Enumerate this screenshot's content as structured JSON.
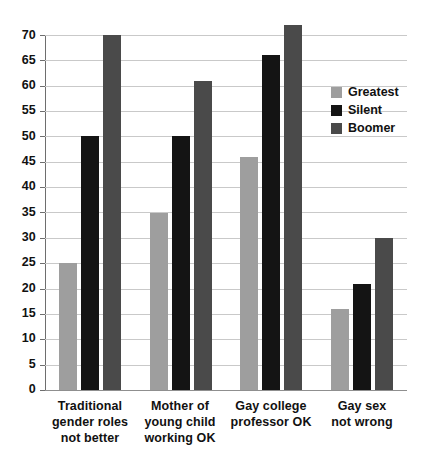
{
  "chart_data": {
    "type": "bar",
    "title": "",
    "subtitle": "",
    "xlabel": "",
    "ylabel": "",
    "ylim": [
      0,
      70
    ],
    "ytick_step": 5,
    "yticks": [
      0,
      5,
      10,
      15,
      20,
      25,
      30,
      35,
      40,
      45,
      50,
      55,
      60,
      65,
      70
    ],
    "grid": true,
    "grid_axis": "y",
    "legend_position": "upper right (inside plot)",
    "categories": [
      "Traditional\ngender roles\nnot better",
      "Mother of\nyoung child\nworking OK",
      "Gay college\nprofessor OK",
      "Gay sex\nnot wrong"
    ],
    "series": [
      {
        "name": "Greatest",
        "color": "#9e9e9e",
        "values": [
          25,
          35,
          46,
          16
        ]
      },
      {
        "name": "Silent",
        "color": "#141414",
        "values": [
          50,
          50,
          66,
          21
        ]
      },
      {
        "name": "Boomer",
        "color": "#4a4a4a",
        "values": [
          70,
          61,
          72,
          30
        ]
      }
    ]
  },
  "axis": {
    "y_tick_labels": [
      "70",
      "65",
      "60",
      "55",
      "50",
      "45",
      "40",
      "35",
      "30",
      "25",
      "20",
      "15",
      "10",
      "5",
      "0"
    ]
  },
  "categories_display": [
    {
      "line1": "Traditional",
      "line2": "gender roles",
      "line3": "not better"
    },
    {
      "line1": "Mother of",
      "line2": "young child",
      "line3": "working OK"
    },
    {
      "line1": "Gay college",
      "line2": "professor OK",
      "line3": ""
    },
    {
      "line1": "Gay sex",
      "line2": "not wrong",
      "line3": ""
    }
  ],
  "legend": {
    "items": [
      {
        "label": "Greatest",
        "color": "#9e9e9e"
      },
      {
        "label": "Silent",
        "color": "#141414"
      },
      {
        "label": "Boomer",
        "color": "#4a4a4a"
      }
    ]
  },
  "colors": {
    "background": "#ffffff",
    "gridline": "#c9c9c9",
    "axis": "#6e6e6e",
    "text": "#111111"
  }
}
